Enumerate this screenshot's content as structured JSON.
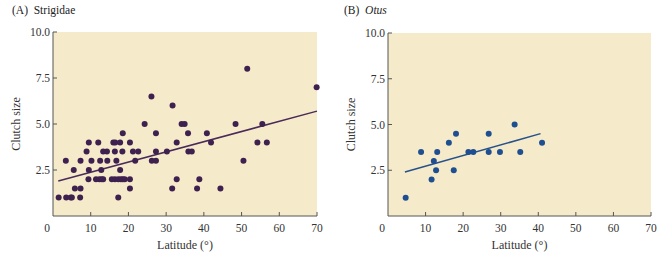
{
  "figure": {
    "panel_a": {
      "letter": "(A)",
      "name": "Strigidae",
      "italic": false
    },
    "panel_b": {
      "letter": "(B)",
      "name": "Otus",
      "italic": true
    }
  },
  "colors": {
    "plot_bg": "#f5ebca",
    "axis": "#555555",
    "panel_a_points": "#3f2150",
    "panel_a_line": "#4a2a5a",
    "panel_b_points": "#1e4f91",
    "panel_b_line": "#27518a"
  },
  "chart_data": [
    {
      "type": "scatter",
      "title": "(A) Strigidae",
      "xlabel": "Latitude (°)",
      "ylabel": "Clutch size",
      "xlim": [
        0,
        70
      ],
      "ylim": [
        0,
        10
      ],
      "xticks": [
        0,
        10,
        20,
        30,
        40,
        50,
        60,
        70
      ],
      "yticks": [
        2.5,
        5.0,
        7.5,
        10.0
      ],
      "ytick_labels": [
        "2.5",
        "5.0",
        "7.5",
        "10.0"
      ],
      "grid": false,
      "points": [
        [
          1.5,
          1.0
        ],
        [
          3.5,
          1.0
        ],
        [
          4.7,
          1.0
        ],
        [
          5.0,
          1.0
        ],
        [
          7.2,
          1.0
        ],
        [
          17.3,
          1.0
        ],
        [
          5.8,
          1.5
        ],
        [
          7.3,
          1.5
        ],
        [
          20.4,
          1.5
        ],
        [
          31.6,
          1.5
        ],
        [
          38.2,
          1.5
        ],
        [
          44.4,
          1.5
        ],
        [
          9.4,
          2.0
        ],
        [
          11.4,
          2.0
        ],
        [
          12.3,
          2.0
        ],
        [
          12.9,
          2.0
        ],
        [
          13.3,
          2.0
        ],
        [
          15.6,
          2.0
        ],
        [
          16.4,
          2.0
        ],
        [
          17.3,
          2.0
        ],
        [
          18.0,
          2.0
        ],
        [
          18.5,
          2.0
        ],
        [
          19.0,
          2.0
        ],
        [
          20.4,
          2.0
        ],
        [
          32.8,
          2.0
        ],
        [
          38.8,
          2.0
        ],
        [
          5.5,
          2.5
        ],
        [
          9.5,
          2.5
        ],
        [
          12.8,
          2.5
        ],
        [
          17.8,
          2.5
        ],
        [
          3.4,
          3.0
        ],
        [
          7.3,
          3.0
        ],
        [
          10.2,
          3.0
        ],
        [
          12.5,
          3.0
        ],
        [
          14.4,
          3.0
        ],
        [
          16.8,
          3.0
        ],
        [
          21.8,
          3.0
        ],
        [
          26.2,
          3.0
        ],
        [
          27.3,
          3.0
        ],
        [
          50.5,
          3.0
        ],
        [
          8.9,
          3.5
        ],
        [
          13.3,
          3.5
        ],
        [
          14.3,
          3.5
        ],
        [
          16.4,
          3.5
        ],
        [
          18.4,
          3.5
        ],
        [
          21.2,
          3.5
        ],
        [
          22.6,
          3.5
        ],
        [
          27.3,
          3.5
        ],
        [
          30.2,
          3.5
        ],
        [
          35.9,
          3.5
        ],
        [
          36.8,
          3.5
        ],
        [
          9.5,
          4.0
        ],
        [
          12.0,
          4.0
        ],
        [
          16.0,
          4.0
        ],
        [
          16.5,
          4.0
        ],
        [
          17.8,
          4.0
        ],
        [
          20.4,
          4.0
        ],
        [
          32.8,
          4.0
        ],
        [
          41.9,
          4.0
        ],
        [
          54.2,
          4.0
        ],
        [
          56.7,
          4.0
        ],
        [
          18.5,
          4.5
        ],
        [
          27.3,
          4.5
        ],
        [
          35.8,
          4.5
        ],
        [
          40.8,
          4.5
        ],
        [
          24.3,
          5.0
        ],
        [
          34.1,
          5.0
        ],
        [
          34.9,
          5.0
        ],
        [
          48.4,
          5.0
        ],
        [
          55.5,
          5.0
        ],
        [
          31.7,
          6.0
        ],
        [
          26.1,
          6.5
        ],
        [
          51.5,
          8.0
        ],
        [
          69.9,
          7.0
        ]
      ],
      "regression_line": {
        "x": [
          1.4,
          70
        ],
        "y": [
          1.9,
          5.7
        ]
      }
    },
    {
      "type": "scatter",
      "title": "(B) Otus",
      "xlabel": "Latitude (°)",
      "ylabel": "Clutch size",
      "xlim": [
        0,
        70
      ],
      "ylim": [
        0,
        10
      ],
      "xticks": [
        0,
        10,
        20,
        30,
        40,
        50,
        60,
        70
      ],
      "yticks": [
        2.5,
        5.0,
        7.5,
        10.0
      ],
      "ytick_labels": [
        "2.5",
        "5.0",
        "7.5",
        "10.0"
      ],
      "grid": false,
      "points": [
        [
          4.7,
          1.0
        ],
        [
          8.8,
          3.5
        ],
        [
          11.6,
          2.0
        ],
        [
          12.2,
          3.0
        ],
        [
          12.8,
          2.5
        ],
        [
          13.1,
          3.5
        ],
        [
          16.2,
          4.0
        ],
        [
          17.5,
          2.5
        ],
        [
          18.1,
          4.5
        ],
        [
          21.4,
          3.5
        ],
        [
          22.7,
          3.5
        ],
        [
          26.8,
          4.5
        ],
        [
          26.8,
          3.5
        ],
        [
          29.8,
          3.5
        ],
        [
          33.7,
          5.0
        ],
        [
          35.2,
          3.5
        ],
        [
          41.0,
          4.0
        ]
      ],
      "regression_line": {
        "x": [
          4.5,
          40.6
        ],
        "y": [
          2.4,
          4.5
        ]
      }
    }
  ]
}
